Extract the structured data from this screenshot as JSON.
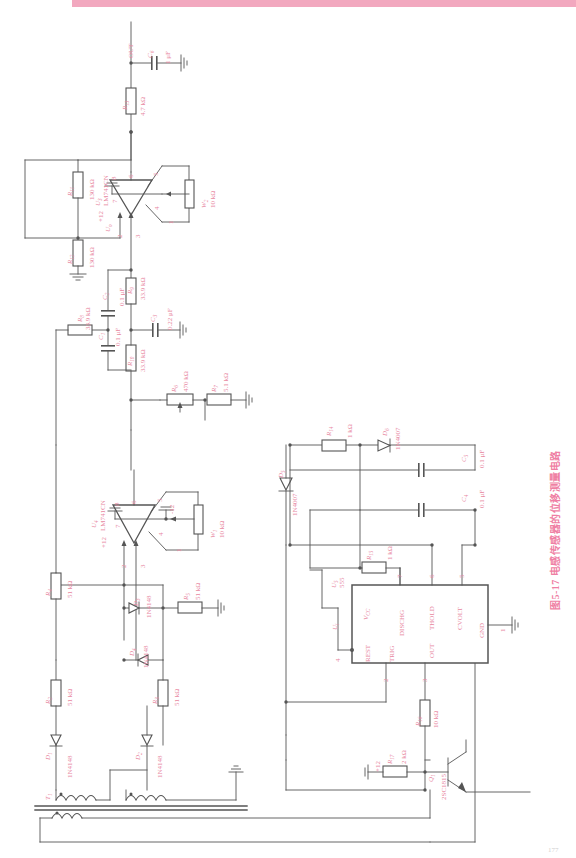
{
  "page": {
    "figure_caption": "图5-17  电感传感器的位移测量电路",
    "folio": "177",
    "accent_color": "#e8889f",
    "band_color": "#f2a8bf",
    "line_color": "#555555"
  },
  "nets": {
    "output_label": "OUT",
    "supply_pos": "+12",
    "supply_neg": "-12",
    "signal_u1": "U1",
    "signal_u2": "U2",
    "signal_ui": "Ui",
    "signal_uo": "Uo"
  },
  "components": {
    "resistors": [
      {
        "ref": "R13",
        "value": "4.7 kΩ"
      },
      {
        "ref": "R11",
        "value": "130 kΩ"
      },
      {
        "ref": "R12",
        "value": "130 kΩ"
      },
      {
        "ref": "R8",
        "value": "33.9 kΩ"
      },
      {
        "ref": "R9",
        "value": "33.9 kΩ"
      },
      {
        "ref": "R10",
        "value": "33.9 kΩ"
      },
      {
        "ref": "R6",
        "value": "470 kΩ"
      },
      {
        "ref": "R7",
        "value": "5.1 kΩ"
      },
      {
        "ref": "R5",
        "value": "51 kΩ"
      },
      {
        "ref": "R4",
        "value": "51 kΩ"
      },
      {
        "ref": "R2",
        "value": "51 kΩ"
      },
      {
        "ref": "R3",
        "value": "51 kΩ"
      },
      {
        "ref": "R1",
        "value": "51 kΩ"
      },
      {
        "ref": "R14",
        "value": "1 kΩ"
      },
      {
        "ref": "R15",
        "value": "1 kΩ"
      },
      {
        "ref": "R16",
        "value": "10 kΩ"
      },
      {
        "ref": "R17",
        "value": "2 kΩ"
      }
    ],
    "capacitors": [
      {
        "ref": "C6",
        "value": "1 μF"
      },
      {
        "ref": "C4",
        "value": "0.1 μF"
      },
      {
        "ref": "C5",
        "value": "0.1 μF"
      },
      {
        "ref": "C3",
        "value": "0.22 μF"
      },
      {
        "ref": "C2",
        "value": "0.1 μF"
      },
      {
        "ref": "C1",
        "value": "0.1 μF"
      }
    ],
    "potentiometers": [
      {
        "ref": "W2",
        "value": "10 kΩ"
      },
      {
        "ref": "W1",
        "value": "10 kΩ"
      }
    ],
    "diodes": [
      {
        "ref": "D5",
        "type": "1N4007"
      },
      {
        "ref": "D6",
        "type": "1N4007"
      },
      {
        "ref": "D3",
        "type": "1N4148"
      },
      {
        "ref": "D4",
        "type": "1N4148"
      },
      {
        "ref": "D1",
        "type": "1N4148"
      },
      {
        "ref": "D2",
        "type": "1N4148"
      }
    ],
    "transistors": [
      {
        "ref": "Q1",
        "type": "2SC1815"
      }
    ],
    "opamps": [
      {
        "ref": "U3",
        "type": "LM741CN",
        "pins": [
          "8",
          "6",
          "5",
          "7",
          "4",
          "2",
          "3",
          "1"
        ]
      },
      {
        "ref": "U4",
        "type": "LM741CN",
        "pins": [
          "8",
          "6",
          "5",
          "7",
          "4",
          "2",
          "3",
          "1"
        ]
      }
    ],
    "timer": {
      "ref": "U5",
      "type": "555",
      "pin_labels": {
        "vcc": "VCC",
        "dischg": "DISCHG",
        "thold": "THOLD",
        "cvolt": "CVOLT",
        "gnd": "GND",
        "rest": "REST",
        "trig": "TRIG",
        "out": "OUT"
      },
      "pin_numbers": {
        "vcc": "8",
        "dischg": "7",
        "thold": "6",
        "cvolt": "5",
        "gnd": "1",
        "rest": "4",
        "trig": "2",
        "out": "3"
      }
    },
    "transformer": {
      "ref": "T1",
      "note": "LVDT sensor coils"
    }
  }
}
